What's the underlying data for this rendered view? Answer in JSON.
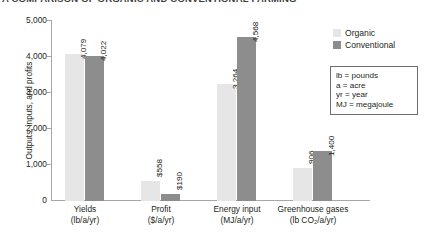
{
  "title": "A COMPARISON OF ORGANIC AND CONVENTIONAL FARMING",
  "chart_data": {
    "type": "bar",
    "title": "A COMPARISON OF ORGANIC AND CONVENTIONAL FARMING",
    "xlabel": "",
    "ylabel": "Outputs, inputs, and profits",
    "ylim": [
      0,
      5000
    ],
    "yticks": [
      "0",
      "1,000",
      "2,000",
      "3,000",
      "4,000",
      "5,000"
    ],
    "ytick_values": [
      0,
      1000,
      2000,
      3000,
      4000,
      5000
    ],
    "grid": false,
    "legend_position": "top-right",
    "categories": [
      {
        "name": "Yields",
        "unit": "(lb/a/yr)"
      },
      {
        "name": "Profit",
        "unit": "($/a/yr)"
      },
      {
        "name": "Energy input",
        "unit": "(MJ/a/yr)"
      },
      {
        "name": "Greenhouse gases",
        "unit": "(lb CO₂/a/yr)"
      }
    ],
    "series": [
      {
        "name": "Organic",
        "color": "#e6e6e6",
        "values": [
          4079,
          558,
          3264,
          906
        ],
        "labels": [
          "4,079",
          "$558",
          "3,264",
          "906"
        ]
      },
      {
        "name": "Conventional",
        "color": "#8d8d8d",
        "values": [
          4022,
          190,
          4568,
          1400
        ],
        "labels": [
          "4,022",
          "$190",
          "4,568",
          "1,400"
        ]
      }
    ]
  },
  "legend": {
    "items": [
      {
        "label": "Organic",
        "color": "#e6e6e6"
      },
      {
        "label": "Conventional",
        "color": "#8d8d8d"
      }
    ]
  },
  "key_box": {
    "lines": [
      "lb = pounds",
      "a = acre",
      "yr = year",
      "MJ = megajoule"
    ]
  }
}
